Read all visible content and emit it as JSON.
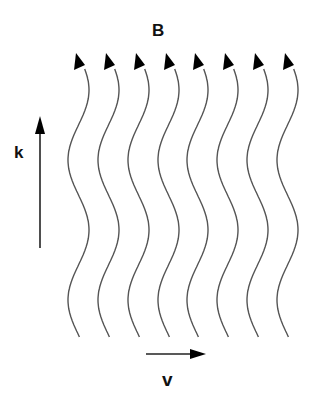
{
  "labels": {
    "field": "B",
    "wavevector": "k",
    "velocity": "v"
  },
  "waves": {
    "count": 8,
    "x_positions": [
      78,
      108,
      138,
      168,
      197,
      227,
      257,
      287
    ],
    "stroke_color": "#555555",
    "arrowhead_color": "#000000"
  },
  "arrows": {
    "k_direction": "up",
    "v_direction": "right"
  }
}
